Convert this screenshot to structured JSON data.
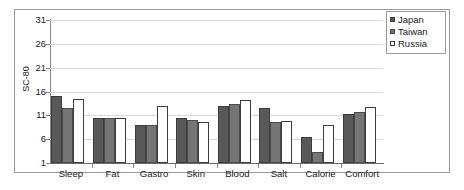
{
  "chart_data": {
    "type": "bar",
    "title": "",
    "xlabel": "",
    "ylabel": "SC-80",
    "ylim": [
      1,
      31
    ],
    "yticks": [
      1,
      6,
      11,
      16,
      21,
      26,
      31
    ],
    "grid": true,
    "legend_position": "top-right",
    "categories": [
      "Sleep",
      "Fat",
      "Gastro",
      "Skin",
      "Blood",
      "Salt",
      "Calorie",
      "Comfort"
    ],
    "series": [
      {
        "name": "Japan",
        "color": "#595959",
        "values": [
          15.0,
          10.5,
          9.0,
          10.5,
          13.0,
          12.5,
          6.5,
          11.3
        ]
      },
      {
        "name": "Taiwan",
        "color": "#757575",
        "values": [
          12.5,
          10.5,
          9.0,
          10.0,
          13.3,
          9.7,
          3.3,
          11.7
        ]
      },
      {
        "name": "Russia",
        "color": "#ffffff",
        "values": [
          14.5,
          10.5,
          13.0,
          9.5,
          14.3,
          9.8,
          9.0,
          12.8
        ]
      }
    ]
  },
  "legend": {
    "items": [
      {
        "label": "Japan"
      },
      {
        "label": "Taiwan"
      },
      {
        "label": "Russia"
      }
    ]
  },
  "axis": {
    "y_title": "SC-80",
    "y_tick_labels": [
      "31",
      "26",
      "21",
      "16",
      "11",
      "6",
      "1"
    ],
    "x_tick_labels": [
      "Sleep",
      "Fat",
      "Gastro",
      "Skin",
      "Blood",
      "Salt",
      "Calorie",
      "Comfort"
    ]
  },
  "colors": {
    "japan": "#595959",
    "taiwan": "#757575",
    "russia": "#ffffff",
    "grid": "#d9d9d9",
    "axis": "#8a8a8a",
    "frame": "#9a9a9a",
    "text": "#1a1a1a"
  }
}
